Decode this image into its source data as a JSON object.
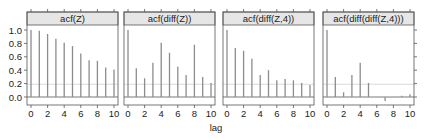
{
  "chart_data": {
    "type": "bar",
    "subtype": "acf-lollipop-trellis",
    "xlabel": "lag",
    "ylabel": "",
    "ylim": [
      -0.1,
      1.05
    ],
    "xlim": [
      -0.5,
      10.5
    ],
    "x": [
      0,
      1,
      2,
      3,
      4,
      5,
      6,
      7,
      8,
      9,
      10
    ],
    "xticks": [
      "0",
      "2",
      "4",
      "6",
      "8",
      "10"
    ],
    "yticks": [
      "0.0",
      "0.2",
      "0.4",
      "0.6",
      "0.8",
      "1.0"
    ],
    "confidence_line": 0.19,
    "grid": false,
    "legend": null,
    "panels": [
      {
        "title": "acf(Z)",
        "values": [
          1.0,
          0.99,
          0.94,
          0.87,
          0.81,
          0.76,
          0.65,
          0.55,
          0.54,
          0.44,
          0.41
        ]
      },
      {
        "title": "acf(diff(Z))",
        "values": [
          1.0,
          0.43,
          0.28,
          0.51,
          0.81,
          0.66,
          0.45,
          0.33,
          0.78,
          0.3,
          0.21
        ]
      },
      {
        "title": "acf(diff(Z,4))",
        "values": [
          1.0,
          0.73,
          0.69,
          0.57,
          0.33,
          0.4,
          0.25,
          0.27,
          0.25,
          0.21,
          0.18
        ]
      },
      {
        "title": "acf(diff(diff(Z,4)))",
        "values": [
          1.0,
          0.3,
          0.07,
          0.33,
          0.51,
          0.21,
          0.0,
          -0.06,
          0.0,
          0.02,
          0.04
        ]
      }
    ]
  },
  "colors": {
    "bar": "#8c8c8c",
    "strip_bg": "#e6e6e6",
    "frame": "#555555",
    "confidence": "#d0d0d0"
  }
}
